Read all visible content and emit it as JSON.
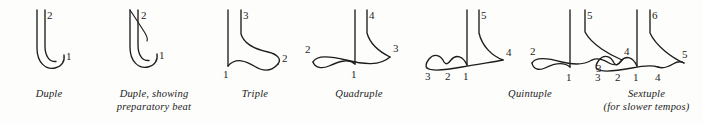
{
  "figure": {
    "background_color": "#fdfdfb",
    "stroke_color": "#1d1d1d",
    "text_color": "#1e1e1e"
  },
  "patterns": [
    {
      "id": "duple",
      "caption_line1": "Duple",
      "caption_line2": "",
      "beats": [
        "1",
        "2"
      ],
      "beat_count": 2,
      "has_preparatory_beat": false
    },
    {
      "id": "duple-preparatory",
      "caption_line1": "Duple, showing",
      "caption_line2": "preparatory beat",
      "beats": [
        "1",
        "2"
      ],
      "beat_count": 2,
      "has_preparatory_beat": true
    },
    {
      "id": "triple",
      "caption_line1": "Triple",
      "caption_line2": "",
      "beats": [
        "1",
        "2",
        "3"
      ],
      "beat_count": 3,
      "has_preparatory_beat": false
    },
    {
      "id": "quadruple",
      "caption_line1": "Quadruple",
      "caption_line2": "",
      "beats": [
        "2",
        "1",
        "3",
        "4"
      ],
      "beat_count": 4,
      "has_preparatory_beat": false
    },
    {
      "id": "quintuple-a",
      "caption_line1": "Quintuple",
      "caption_line2": "",
      "beats": [
        "3",
        "2",
        "1",
        "4",
        "5"
      ],
      "beat_count": 5,
      "has_preparatory_beat": false
    },
    {
      "id": "quintuple-b",
      "caption_line1": "",
      "caption_line2": "",
      "beats": [
        "2",
        "1",
        "3",
        "4",
        "5"
      ],
      "beat_count": 5,
      "has_preparatory_beat": false
    },
    {
      "id": "sextuple",
      "caption_line1": "Sextuple",
      "caption_line2": "(for slower tempos)",
      "beats": [
        "3",
        "2",
        "1",
        "4",
        "5",
        "6"
      ],
      "beat_count": 6,
      "has_preparatory_beat": false
    }
  ],
  "labels": {
    "duple": {
      "n1": "1",
      "n2": "2"
    },
    "duple_prep": {
      "n1": "1",
      "n2": "2"
    },
    "triple": {
      "n1": "1",
      "n2": "2",
      "n3": "3"
    },
    "quadruple": {
      "n1": "1",
      "n2": "2",
      "n3": "3",
      "n4": "4"
    },
    "quintuple_a": {
      "n1": "1",
      "n2": "2",
      "n3": "3",
      "n4": "4",
      "n5": "5"
    },
    "quintuple_b": {
      "n1": "1",
      "n2": "2",
      "n3": "3",
      "n4": "4",
      "n5": "5"
    },
    "sextuple": {
      "n1": "1",
      "n2": "2",
      "n3": "3",
      "n4": "4",
      "n5": "5",
      "n6": "6"
    }
  },
  "captions": {
    "duple": "Duple",
    "duple_prep_line1": "Duple, showing",
    "duple_prep_line2": "preparatory beat",
    "triple": "Triple",
    "quadruple": "Quadruple",
    "quintuple": "Quintuple",
    "sextuple_line1": "Sextuple",
    "sextuple_line2": "(for slower tempos)"
  }
}
